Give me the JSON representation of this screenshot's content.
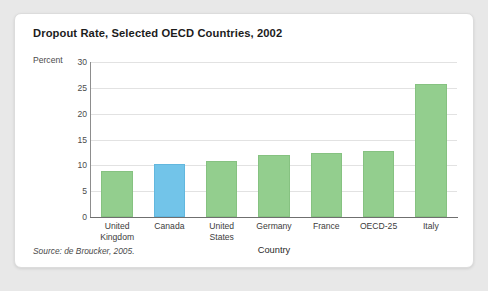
{
  "card": {
    "background_color": "#ffffff",
    "page_background_color": "#e8e8e8"
  },
  "title": "Dropout Rate, Selected OECD Countries, 2002",
  "ylabel_text": "Percent",
  "xlabel_text": "Country",
  "source": "Source: de Broucker, 2005.",
  "colors": {
    "bar_green": "#93ce8e",
    "bar_blue_highlight": "#72c4e9",
    "gridline": "#e2e2e2",
    "axis": "#6f6f6f"
  },
  "chart_data": {
    "type": "bar",
    "title": "Dropout Rate, Selected OECD Countries, 2002",
    "xlabel": "Country",
    "ylabel": "Percent",
    "ylim": [
      0,
      30
    ],
    "yticks": [
      0,
      5,
      10,
      15,
      20,
      25,
      30
    ],
    "ytick_labels": [
      "0",
      "5",
      "10",
      "15",
      "20",
      "25",
      "30"
    ],
    "grid": true,
    "legend": false,
    "categories": [
      "United Kingdom",
      "Canada",
      "United States",
      "Germany",
      "France",
      "OECD-25",
      "Italy"
    ],
    "category_lines": [
      [
        "United",
        "Kingdom"
      ],
      [
        "Canada"
      ],
      [
        "United",
        "States"
      ],
      [
        "Germany"
      ],
      [
        "France"
      ],
      [
        "OECD-25"
      ],
      [
        "Italy"
      ]
    ],
    "values": [
      9.0,
      10.2,
      10.8,
      12.0,
      12.3,
      12.7,
      25.8
    ],
    "bar_colors": [
      "#93ce8e",
      "#72c4e9",
      "#93ce8e",
      "#93ce8e",
      "#93ce8e",
      "#93ce8e",
      "#93ce8e"
    ],
    "highlight_index": 1,
    "annotations": [
      "Source: de Broucker, 2005."
    ]
  }
}
